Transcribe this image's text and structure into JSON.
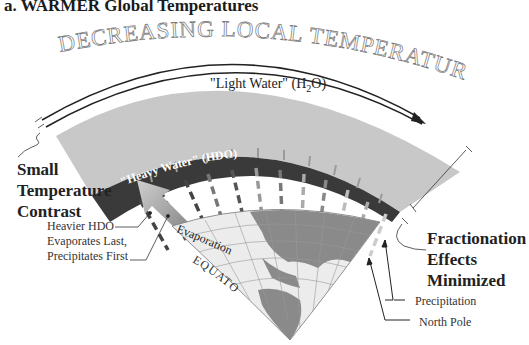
{
  "title": "a. WARMER Global Temperatures",
  "arc_heading": "DECREASING LOCAL TEMPERATURES",
  "layers": {
    "light_water": {
      "label": "\"Light Water\" (H",
      "sub": "2",
      "suffix": "O)",
      "color": "#c8c8c8"
    },
    "heavy_water": {
      "label": "\"Heavy Water\" (HDO)",
      "color": "#3a3a3a"
    }
  },
  "left_callout": {
    "line1": "Small",
    "line2": "Temperature",
    "line3": "Contrast"
  },
  "right_callout": {
    "line1": "Fractionation",
    "line2": "Effects",
    "line3": "Minimized"
  },
  "hdo_note": {
    "line1": "Heavier HDO",
    "line2": "Evaporates Last,",
    "line3": "Precipitates First"
  },
  "globe": {
    "evaporation": "Evaporation",
    "equator": "EQUATOR",
    "land_color": "#8a8a8a",
    "ocean_color": "#ececec"
  },
  "pointers": {
    "precipitation": "Precipitation",
    "north_pole": "North Pole"
  }
}
